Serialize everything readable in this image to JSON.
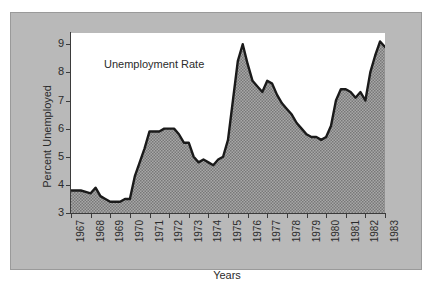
{
  "figure": {
    "panel_bg": "#b9b9b9",
    "plot_bg": "#ffffff",
    "series_fill": "#8f8f8f",
    "line_color": "#1a1a1a",
    "axis_color": "#3b3b3b"
  },
  "axis": {
    "y_title": "Percent Unemployed",
    "x_title": "Years",
    "y_ticks": [
      "3",
      "4",
      "5",
      "6",
      "7",
      "8",
      "9"
    ],
    "x_ticks": [
      "1967",
      "1968",
      "1969",
      "1970",
      "1971",
      "1972",
      "1973",
      "1974",
      "1975",
      "1976",
      "1977",
      "1978",
      "1979",
      "1980",
      "1981",
      "1982",
      "1983"
    ]
  },
  "series_annotation": "Unemployment Rate",
  "chart_data": {
    "type": "area",
    "title": "Unemployment Rate",
    "xlabel": "Years",
    "ylabel": "Percent Unemployed",
    "xlim": [
      1967,
      1983
    ],
    "ylim": [
      3,
      9.4
    ],
    "grid": false,
    "legend": "none",
    "series_name": "Unemployment Rate",
    "x": [
      1967.0,
      1967.25,
      1967.5,
      1967.75,
      1968.0,
      1968.25,
      1968.5,
      1968.75,
      1969.0,
      1969.25,
      1969.5,
      1969.75,
      1970.0,
      1970.25,
      1970.5,
      1970.75,
      1971.0,
      1971.25,
      1971.5,
      1971.75,
      1972.0,
      1972.25,
      1972.5,
      1972.75,
      1973.0,
      1973.25,
      1973.5,
      1973.75,
      1974.0,
      1974.25,
      1974.5,
      1974.75,
      1975.0,
      1975.25,
      1975.5,
      1975.75,
      1976.0,
      1976.25,
      1976.5,
      1976.75,
      1977.0,
      1977.25,
      1977.5,
      1977.75,
      1978.0,
      1978.25,
      1978.5,
      1978.75,
      1979.0,
      1979.25,
      1979.5,
      1979.75,
      1980.0,
      1980.25,
      1980.5,
      1980.75,
      1981.0,
      1981.25,
      1981.5,
      1981.75,
      1982.0,
      1982.25,
      1982.5,
      1982.75,
      1983.0
    ],
    "values": [
      3.8,
      3.8,
      3.8,
      3.75,
      3.7,
      3.9,
      3.6,
      3.5,
      3.4,
      3.4,
      3.4,
      3.5,
      3.5,
      4.3,
      4.8,
      5.3,
      5.9,
      5.9,
      5.9,
      6.0,
      6.0,
      6.0,
      5.8,
      5.5,
      5.5,
      5.0,
      4.8,
      4.9,
      4.8,
      4.7,
      4.9,
      5.0,
      5.6,
      7.0,
      8.4,
      9.0,
      8.3,
      7.7,
      7.5,
      7.3,
      7.7,
      7.6,
      7.2,
      6.9,
      6.7,
      6.5,
      6.2,
      6.0,
      5.8,
      5.7,
      5.7,
      5.6,
      5.7,
      6.1,
      7.0,
      7.4,
      7.4,
      7.3,
      7.1,
      7.3,
      7.0,
      8.0,
      8.6,
      9.1,
      8.9
    ],
    "notable_points": [
      {
        "label": "1969 trough",
        "x": 1969.0,
        "y": 3.4
      },
      {
        "label": "1975 peak",
        "x": 1975.75,
        "y": 9.0
      },
      {
        "label": "1979 trough",
        "x": 1979.75,
        "y": 5.6
      },
      {
        "label": "1982 peak",
        "x": 1982.75,
        "y": 9.1
      }
    ]
  }
}
